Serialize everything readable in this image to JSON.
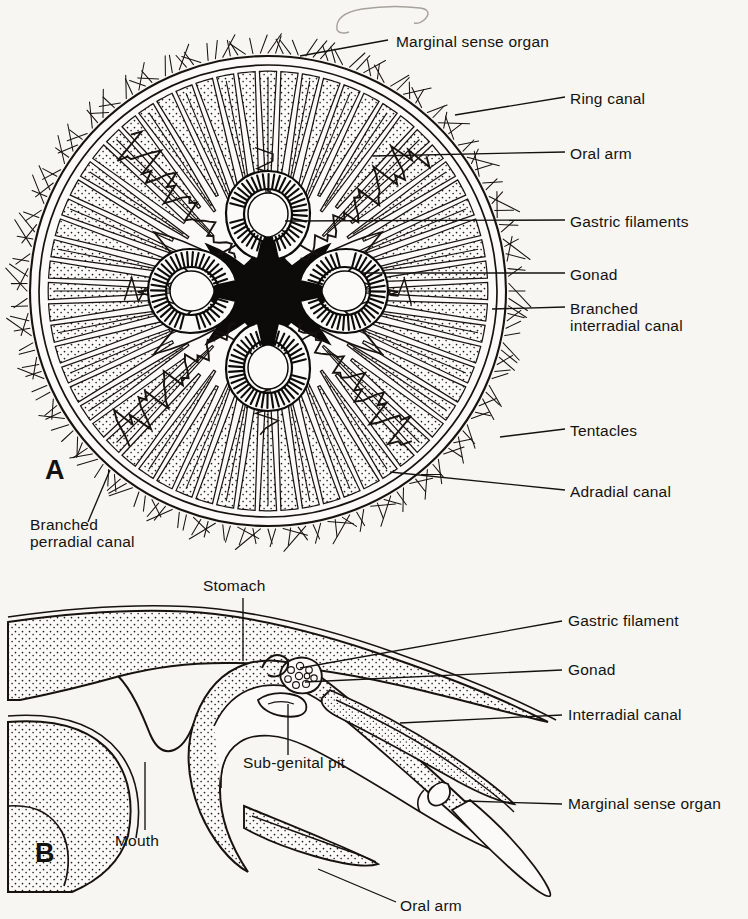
{
  "plate": {
    "title": "Scyphozoan (Aurelia) anatomy plate",
    "background_color": "#f7f6f3",
    "ink_color": "#14120f",
    "panels": [
      {
        "id": "A",
        "letter": "A",
        "view": "oral view of whole medusa",
        "x": 45,
        "y": 470
      },
      {
        "id": "B",
        "letter": "B",
        "view": "vertical section through bell margin",
        "x": 38,
        "y": 855
      }
    ]
  },
  "figure_a": {
    "letter": "A",
    "bell": {
      "cx": 268,
      "cy": 291,
      "rx": 243,
      "ry": 240
    },
    "radial_canal_count": 64,
    "gonad_count": 4,
    "labels": [
      {
        "key": "marginal_sense_organ",
        "text": "Marginal sense organ",
        "lx": 396,
        "ly": 44,
        "leader": [
          [
            388,
            40
          ],
          [
            300,
            56
          ]
        ]
      },
      {
        "key": "ring_canal",
        "text": "Ring canal",
        "lx": 570,
        "ly": 101,
        "leader": [
          [
            565,
            97
          ],
          [
            455,
            115
          ]
        ]
      },
      {
        "key": "oral_arm",
        "text": "Oral  arm",
        "lx": 570,
        "ly": 156,
        "leader": [
          [
            565,
            152
          ],
          [
            373,
            156
          ]
        ]
      },
      {
        "key": "gastric_filaments",
        "text": "Gastric  filaments",
        "lx": 570,
        "ly": 224,
        "leader": [
          [
            565,
            220
          ],
          [
            285,
            221
          ]
        ]
      },
      {
        "key": "gonad",
        "text": "Gonad",
        "lx": 570,
        "ly": 277,
        "leader": [
          [
            565,
            273
          ],
          [
            362,
            273
          ]
        ]
      },
      {
        "key": "branched_interradial_canal",
        "text": "Branched interradial canal",
        "lx": 570,
        "ly": 311,
        "leader": [
          [
            565,
            307
          ],
          [
            492,
            309
          ]
        ]
      },
      {
        "key": "tentacles",
        "text": "Tentacles",
        "lx": 570,
        "ly": 433,
        "leader": [
          [
            565,
            429
          ],
          [
            500,
            437
          ]
        ]
      },
      {
        "key": "adradial_canal",
        "text": "Adradial canal",
        "lx": 570,
        "ly": 494,
        "leader": [
          [
            565,
            490
          ],
          [
            390,
            472
          ]
        ]
      },
      {
        "key": "branched_perradial_canal",
        "text": "Branched perradial canal",
        "lx": 30,
        "ly": 527,
        "leader": [
          [
            88,
            522
          ],
          [
            110,
            470
          ]
        ]
      }
    ]
  },
  "figure_b": {
    "letter": "B",
    "labels": [
      {
        "key": "stomach",
        "text": "Stomach",
        "lx": 203,
        "ly": 588,
        "leader": [
          [
            243,
            598
          ],
          [
            243,
            661
          ]
        ]
      },
      {
        "key": "gastric_filament",
        "text": "Gastric filament",
        "lx": 568,
        "ly": 623,
        "leader": [
          [
            562,
            621
          ],
          [
            300,
            668
          ]
        ]
      },
      {
        "key": "gonad",
        "text": "Gonad",
        "lx": 568,
        "ly": 672,
        "leader": [
          [
            562,
            670
          ],
          [
            305,
            682
          ]
        ]
      },
      {
        "key": "interradial_canal",
        "text": "Interradial canal",
        "lx": 568,
        "ly": 717,
        "leader": [
          [
            562,
            715
          ],
          [
            400,
            723
          ]
        ]
      },
      {
        "key": "sub_genital_pit",
        "text": "Sub-genital pit",
        "lx": 243,
        "ly": 765,
        "leader": [
          [
            288,
            755
          ],
          [
            288,
            704
          ]
        ]
      },
      {
        "key": "marginal_sense_organ",
        "text": "Marginal sense organ",
        "lx": 568,
        "ly": 806,
        "leader": [
          [
            562,
            804
          ],
          [
            465,
            801
          ]
        ]
      },
      {
        "key": "mouth",
        "text": "Mouth",
        "lx": 115,
        "ly": 843,
        "leader": [
          [
            145,
            830
          ],
          [
            145,
            762
          ]
        ]
      },
      {
        "key": "oral_arm",
        "text": "Oral arm",
        "lx": 400,
        "ly": 908,
        "leader": [
          [
            396,
            902
          ],
          [
            318,
            869
          ]
        ]
      }
    ]
  },
  "annotations": {
    "pencil_mark": {
      "present": true,
      "x": 350,
      "y": 8,
      "description": "faint pencil scribble at top of page"
    }
  }
}
